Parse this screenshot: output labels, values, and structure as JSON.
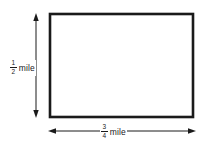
{
  "diagram": {
    "type": "dimensioned-rectangle",
    "labels": {
      "height": {
        "numerator": "1",
        "denominator": "2",
        "unit": "mile"
      },
      "width": {
        "numerator": "3",
        "denominator": "4",
        "unit": "mile"
      }
    },
    "colors": {
      "line": "#1a1a1a",
      "background": "#ffffff"
    }
  }
}
